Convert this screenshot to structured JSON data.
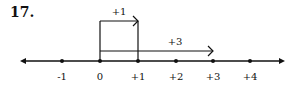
{
  "problem_number": "17.",
  "number_line": {
    "ticks": [
      {
        "value": -1,
        "label": "-1",
        "x": 62
      },
      {
        "value": 0,
        "label": "0",
        "x": 100
      },
      {
        "value": 1,
        "label": "+1",
        "x": 138
      },
      {
        "value": 2,
        "label": "+2",
        "x": 176
      },
      {
        "value": 3,
        "label": "+3",
        "x": 213
      },
      {
        "value": 4,
        "label": "+4",
        "x": 250
      }
    ],
    "arrows": [
      {
        "label": "+1",
        "from": 0,
        "to": 1
      },
      {
        "label": "+3",
        "from": 0,
        "to": 3
      }
    ]
  }
}
